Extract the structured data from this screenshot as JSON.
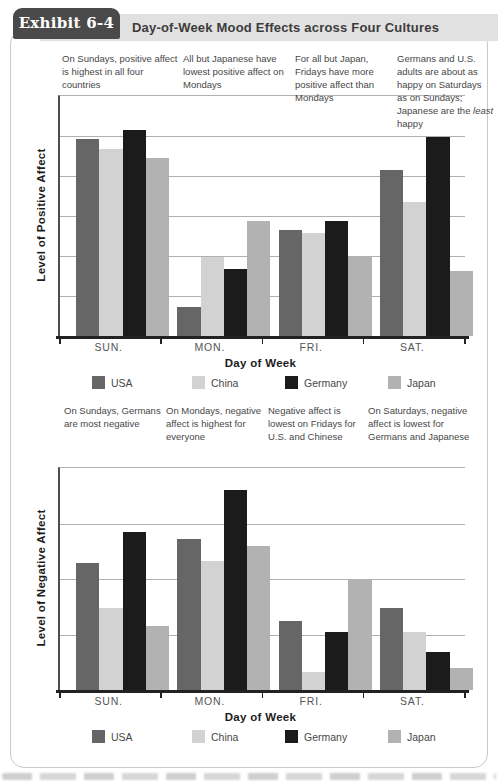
{
  "header": {
    "badge": "Exhibit 6-4",
    "title": "Day-of-Week Mood Effects across Four Cultures"
  },
  "legend": [
    "USA",
    "China",
    "Germany",
    "Japan"
  ],
  "colors": {
    "series": {
      "USA": "#666666",
      "China": "#d2d2d2",
      "Germany": "#1b1b1b",
      "Japan": "#b2b2b2"
    },
    "badge_bg": "#4a4a4a",
    "title_bar_bg": "#e1e1e1",
    "gridline": "#b0b0b0",
    "axis": "#222222"
  },
  "chart_data": [
    {
      "type": "bar",
      "ylabel": "Level of Positive Affect",
      "xlabel": "Day of Week",
      "categories": [
        "SUN.",
        "MON.",
        "FRI.",
        "SAT."
      ],
      "series": [
        {
          "name": "USA",
          "values": [
            82,
            12,
            44,
            69
          ]
        },
        {
          "name": "China",
          "values": [
            78,
            33,
            43,
            56
          ]
        },
        {
          "name": "Germany",
          "values": [
            86,
            28,
            48,
            83
          ]
        },
        {
          "name": "Japan",
          "values": [
            74,
            48,
            33,
            27
          ]
        }
      ],
      "ylim": [
        0,
        100
      ],
      "y_units": "relative level (axis unlabeled)",
      "grid": "horizontal",
      "gridline_rows": 6,
      "legend_position": "bottom",
      "annotations": [
        {
          "text": "On Sundays, positive affect is highest in all four countries"
        },
        {
          "text": "All but Japanese have lowest positive affect on Mondays"
        },
        {
          "text": "For all but Japan, Fridays have more positive affect than Mondays"
        },
        {
          "text": "Germans and U.S. adults are about as happy on Saturdays as on Sundays; Japanese are the least happy",
          "italic": "least"
        }
      ]
    },
    {
      "type": "bar",
      "ylabel": "Level of Negative Affect",
      "xlabel": "Day of Week",
      "categories": [
        "SUN.",
        "MON.",
        "FRI.",
        "SAT."
      ],
      "series": [
        {
          "name": "USA",
          "values": [
            57,
            68,
            31,
            37
          ]
        },
        {
          "name": "China",
          "values": [
            37,
            58,
            8,
            26
          ]
        },
        {
          "name": "Germany",
          "values": [
            71,
            90,
            26,
            17
          ]
        },
        {
          "name": "Japan",
          "values": [
            29,
            65,
            50,
            10
          ]
        }
      ],
      "ylim": [
        0,
        100
      ],
      "y_units": "relative level (axis unlabeled)",
      "grid": "horizontal",
      "gridline_rows": 4,
      "legend_position": "bottom",
      "annotations": [
        {
          "text": "On Sundays, Germans are most negative"
        },
        {
          "text": "On Mondays, negative affect is highest for everyone"
        },
        {
          "text": "Negative affect is lowest on Fridays for U.S. and Chinese"
        },
        {
          "text": "On Saturdays, negative affect is lowest for Germans and Japanese"
        }
      ]
    }
  ]
}
